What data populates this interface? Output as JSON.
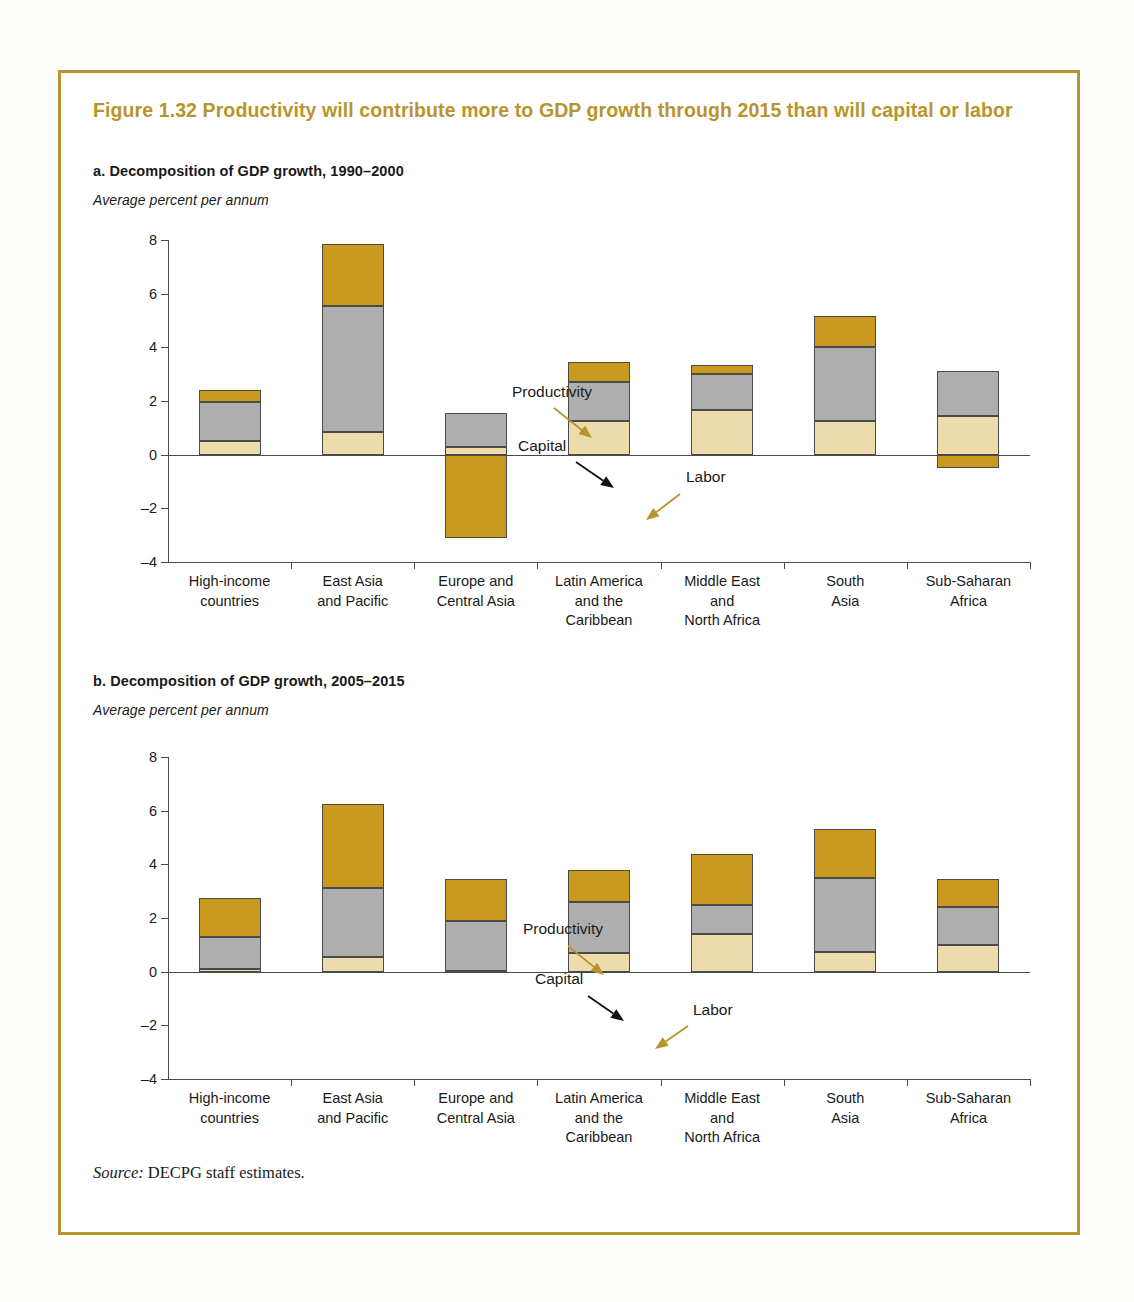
{
  "figure": {
    "title": "Figure 1.32  Productivity will contribute more to GDP growth through 2015 than will capital or labor",
    "accent_color": "#b8942c",
    "source_prefix": "Source:",
    "source_text": " DECPG staff estimates."
  },
  "panels": [
    {
      "id": "a",
      "title": "a. Decomposition of GDP growth, 1990–2000",
      "axis_note": "Average percent per annum"
    },
    {
      "id": "b",
      "title": "b. Decomposition of GDP growth, 2005–2015",
      "axis_note": "Average percent per annum"
    }
  ],
  "annotations": {
    "productivity": "Productivity",
    "capital": "Capital",
    "labor": "Labor"
  },
  "colors": {
    "productivity": "#c99a1e",
    "capital": "#aeaeae",
    "labor": "#ecdcac",
    "axis": "#4a4a4a",
    "arrow_gold": "#b8922c",
    "arrow_black": "#111111"
  },
  "chart_data": [
    {
      "type": "bar",
      "subtype": "stacked",
      "title": "a. Decomposition of GDP growth, 1990–2000",
      "xlabel": "",
      "ylabel": "Average percent per annum",
      "ylim": [
        -4,
        8
      ],
      "yticks": [
        8,
        6,
        4,
        2,
        0,
        -2,
        -4
      ],
      "ytick_labels": [
        "8",
        "6",
        "4",
        "2",
        "0",
        "–2",
        "–4"
      ],
      "grid": false,
      "legend": "annotated-arrows",
      "categories": [
        "High-income countries",
        "East Asia and Pacific",
        "Europe and Central Asia",
        "Latin America and the Caribbean",
        "Middle East and North Africa",
        "South Asia",
        "Sub-Saharan Africa"
      ],
      "series": [
        {
          "name": "Labor",
          "values": [
            0.5,
            0.85,
            0.3,
            1.25,
            1.65,
            1.25,
            1.45
          ]
        },
        {
          "name": "Capital",
          "values": [
            1.45,
            4.7,
            1.25,
            1.45,
            1.35,
            2.75,
            1.65
          ]
        },
        {
          "name": "Productivity",
          "values": [
            0.45,
            2.3,
            -3.1,
            0.75,
            0.35,
            1.15,
            -0.5
          ]
        }
      ],
      "totals": [
        2.4,
        7.85,
        -1.55,
        3.45,
        3.35,
        5.15,
        2.6
      ]
    },
    {
      "type": "bar",
      "subtype": "stacked",
      "title": "b. Decomposition of GDP growth, 2005–2015",
      "xlabel": "",
      "ylabel": "Average percent per annum",
      "ylim": [
        -4,
        8
      ],
      "yticks": [
        8,
        6,
        4,
        2,
        0,
        -2,
        -4
      ],
      "ytick_labels": [
        "8",
        "6",
        "4",
        "2",
        "0",
        "–2",
        "–4"
      ],
      "grid": false,
      "legend": "annotated-arrows",
      "categories": [
        "High-income countries",
        "East Asia and Pacific",
        "Europe and Central Asia",
        "Latin America and the Caribbean",
        "Middle East and North Africa",
        "South Asia",
        "Sub-Saharan Africa"
      ],
      "series": [
        {
          "name": "Labor",
          "values": [
            0.1,
            0.55,
            0.02,
            0.7,
            1.4,
            0.75,
            1.0
          ]
        },
        {
          "name": "Capital",
          "values": [
            1.2,
            2.55,
            1.88,
            1.9,
            1.1,
            2.75,
            1.4
          ]
        },
        {
          "name": "Productivity",
          "values": [
            1.45,
            3.15,
            1.55,
            1.2,
            1.9,
            1.8,
            1.05
          ]
        }
      ],
      "totals": [
        2.75,
        6.25,
        3.45,
        3.8,
        4.4,
        5.3,
        3.45
      ]
    }
  ],
  "category_label_lines": [
    [
      "High-income",
      "countries"
    ],
    [
      "East Asia",
      "and Pacific"
    ],
    [
      "Europe and",
      "Central Asia"
    ],
    [
      "Latin America",
      "and the",
      "Caribbean"
    ],
    [
      "Middle East",
      "and",
      "North Africa"
    ],
    [
      "South",
      "Asia"
    ],
    [
      "Sub-Saharan",
      "Africa"
    ]
  ]
}
